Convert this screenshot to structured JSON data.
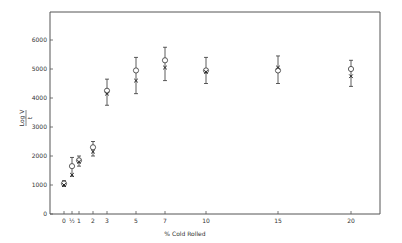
{
  "chart_data": {
    "type": "scatter",
    "title": "",
    "xlabel": "% Cold Rolled",
    "ylabel": "Log V / t",
    "ylim": [
      0,
      7000
    ],
    "y_ticks": [
      0,
      1000,
      2000,
      3000,
      4000,
      5000,
      6000
    ],
    "x_ticks": [
      {
        "value": 0,
        "label": "0"
      },
      {
        "value": 0.5,
        "label": "½"
      },
      {
        "value": 1,
        "label": "1"
      },
      {
        "value": 2,
        "label": "2"
      },
      {
        "value": 3,
        "label": "3"
      },
      {
        "value": 5,
        "label": "5"
      },
      {
        "value": 7,
        "label": "7"
      },
      {
        "value": 10,
        "label": "10"
      },
      {
        "value": 15,
        "label": "15"
      },
      {
        "value": 20,
        "label": "20"
      }
    ],
    "grid": false,
    "legend": null,
    "series": [
      {
        "name": "open circles",
        "marker": "circle",
        "x": [
          0,
          0.5,
          1,
          2,
          3,
          5,
          7,
          10,
          15,
          20
        ],
        "y": [
          1050,
          1650,
          1850,
          2300,
          4250,
          4950,
          5300,
          4950,
          4950,
          5000
        ],
        "err_low": [
          950,
          1300,
          1650,
          2000,
          3750,
          4150,
          4600,
          4500,
          4500,
          4400
        ],
        "err_high": [
          1150,
          1950,
          2000,
          2500,
          4650,
          5400,
          5750,
          5400,
          5450,
          5300
        ]
      },
      {
        "name": "crosses",
        "marker": "cross",
        "x": [
          0,
          0.5,
          1,
          2,
          3,
          5,
          7,
          10,
          15,
          20
        ],
        "y": [
          1000,
          1350,
          1800,
          2150,
          4150,
          4600,
          5050,
          4900,
          5050,
          4750
        ]
      }
    ]
  }
}
